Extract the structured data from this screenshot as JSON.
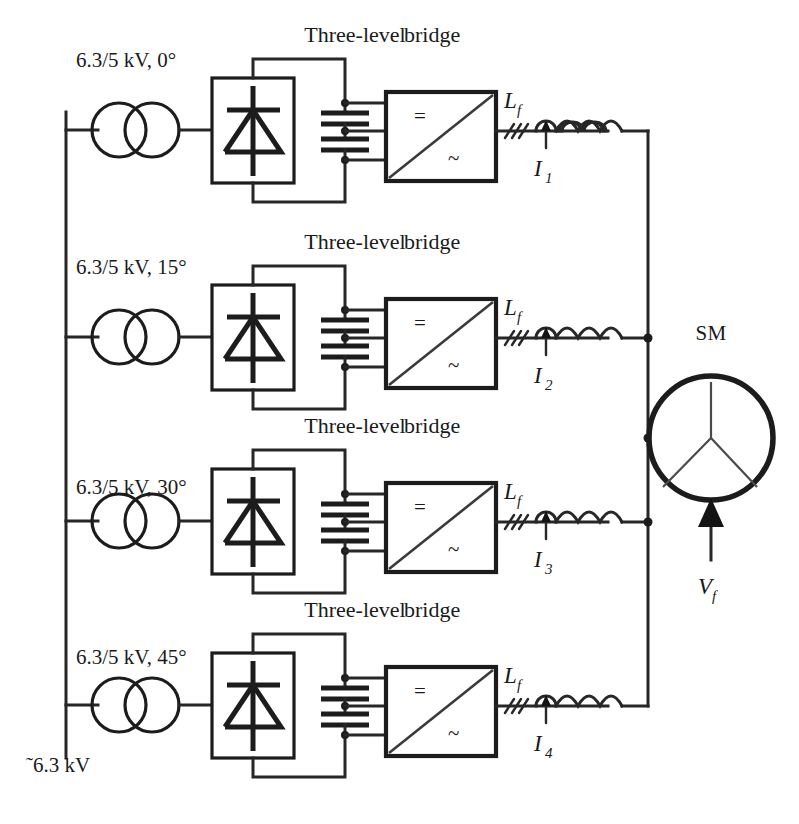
{
  "diagram": {
    "type": "electrical-schematic",
    "source_label": "˜6.3 kV",
    "source_label_plain": "~6.3 kV",
    "machine": {
      "label": "SM",
      "field_voltage_label": "V",
      "field_voltage_sub": "f"
    },
    "colors": {
      "line": "#1c1c1c",
      "background": "#ffffff",
      "diagonal": "#3a3a3a"
    },
    "branches": [
      {
        "transformer_label": "6.3/5 kV, 0°",
        "bridge_label_line1": "Three-level",
        "bridge_label_line2": "bridge",
        "bridge_dc_symbol": "=",
        "bridge_ac_symbol": "~",
        "inductor_label": "L",
        "inductor_sub": "f",
        "current_label": "I",
        "current_sub": "1"
      },
      {
        "transformer_label": "6.3/5 kV, 15°",
        "bridge_label_line1": "Three-level",
        "bridge_label_line2": "bridge",
        "bridge_dc_symbol": "=",
        "bridge_ac_symbol": "~",
        "inductor_label": "L",
        "inductor_sub": "f",
        "current_label": "I",
        "current_sub": "2"
      },
      {
        "transformer_label": "6.3/5 kV, 30°",
        "bridge_label_line1": "Three-level",
        "bridge_label_line2": "bridge",
        "bridge_dc_symbol": "=",
        "bridge_ac_symbol": "~",
        "inductor_label": "L",
        "inductor_sub": "f",
        "current_label": "I",
        "current_sub": "3"
      },
      {
        "transformer_label": "6.3/5 kV, 45°",
        "bridge_label_line1": "Three-level",
        "bridge_label_line2": "bridge",
        "bridge_dc_symbol": "=",
        "bridge_ac_symbol": "~",
        "inductor_label": "L",
        "inductor_sub": "f",
        "current_label": "I",
        "current_sub": "4"
      }
    ]
  }
}
